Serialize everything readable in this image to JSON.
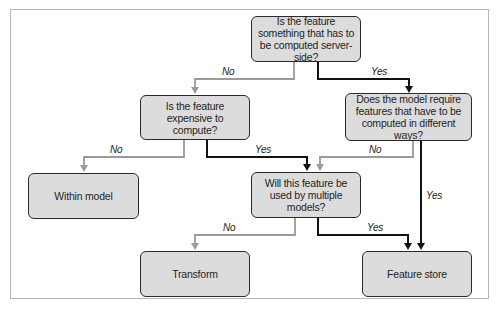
{
  "diagram": {
    "type": "flowchart",
    "nodes": [
      {
        "id": "q1",
        "kind": "decision",
        "label": "Is the feature something that has to be computed server-side?"
      },
      {
        "id": "q2",
        "kind": "decision",
        "label": "Is the feature expensive to compute?"
      },
      {
        "id": "q3",
        "kind": "decision",
        "label": "Does the model require features that have to be computed in different ways?"
      },
      {
        "id": "q4",
        "kind": "decision",
        "label": "Will this feature be used by multiple models?"
      },
      {
        "id": "r1",
        "kind": "outcome",
        "label": "Within model"
      },
      {
        "id": "r2",
        "kind": "outcome",
        "label": "Transform"
      },
      {
        "id": "r3",
        "kind": "outcome",
        "label": "Feature store"
      }
    ],
    "edges": [
      {
        "from": "q1",
        "to": "q2",
        "label": "No",
        "color": "#9a9a9a"
      },
      {
        "from": "q1",
        "to": "q3",
        "label": "Yes",
        "color": "#111111"
      },
      {
        "from": "q2",
        "to": "r1",
        "label": "No",
        "color": "#9a9a9a"
      },
      {
        "from": "q2",
        "to": "q4",
        "label": "Yes",
        "color": "#111111"
      },
      {
        "from": "q3",
        "to": "q4",
        "label": "No",
        "color": "#9a9a9a"
      },
      {
        "from": "q3",
        "to": "r3",
        "label": "Yes",
        "color": "#111111"
      },
      {
        "from": "q4",
        "to": "r2",
        "label": "No",
        "color": "#9a9a9a"
      },
      {
        "from": "q4",
        "to": "r3",
        "label": "Yes",
        "color": "#111111"
      }
    ],
    "colors": {
      "box_fill": "#dcdcdc",
      "box_border": "#2a2a2a",
      "yes_line": "#111111",
      "no_line": "#9a9a9a",
      "frame": "#b5b5b5"
    }
  }
}
